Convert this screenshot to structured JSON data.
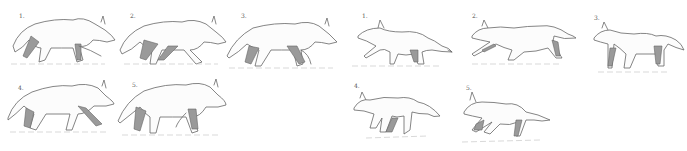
{
  "illustration": {
    "subject": "animal gait sketch sequences",
    "groups": [
      {
        "name": "wolf-walk-sequence",
        "frames": [
          {
            "label": "1.",
            "x": 5,
            "y": 8,
            "w": 110,
            "h": 56
          },
          {
            "label": "2.",
            "x": 118,
            "y": 10,
            "w": 108,
            "h": 54
          },
          {
            "label": "3.",
            "x": 225,
            "y": 10,
            "w": 112,
            "h": 58
          },
          {
            "label": "4.",
            "x": 6,
            "y": 78,
            "w": 108,
            "h": 54
          },
          {
            "label": "5.",
            "x": 116,
            "y": 77,
            "w": 110,
            "h": 58
          }
        ]
      },
      {
        "name": "fox-gallop-sequence",
        "frames": [
          {
            "label": "1.",
            "x": 352,
            "y": 10,
            "w": 100,
            "h": 56
          },
          {
            "label": "2.",
            "x": 468,
            "y": 12,
            "w": 108,
            "h": 52
          },
          {
            "label": "3.",
            "x": 592,
            "y": 14,
            "w": 92,
            "h": 58
          },
          {
            "label": "4.",
            "x": 352,
            "y": 82,
            "w": 90,
            "h": 58
          },
          {
            "label": "5.",
            "x": 460,
            "y": 84,
            "w": 90,
            "h": 58
          }
        ]
      }
    ],
    "colors": {
      "line": "#666666",
      "shade": "#9a9a9a",
      "ground": "#c8c8c8",
      "background": "#ffffff"
    }
  }
}
